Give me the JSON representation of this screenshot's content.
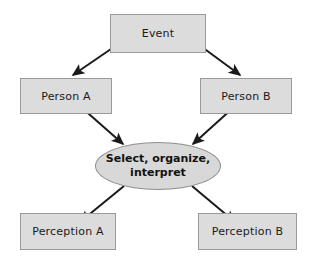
{
  "diagram": {
    "type": "flowchart",
    "colors": {
      "node_fill": "#dcdcdc",
      "node_border": "#9a9a9a",
      "ellipse_fill": "#d8d8d8",
      "ellipse_border": "#8f8f8f",
      "arrow": "#1a1a1a",
      "background": "#ffffff",
      "text": "#1a1a1a"
    },
    "nodes": [
      {
        "id": "event",
        "label": "Event",
        "shape": "rectangle"
      },
      {
        "id": "person_a",
        "label": "Person A",
        "shape": "rectangle"
      },
      {
        "id": "person_b",
        "label": "Person B",
        "shape": "rectangle"
      },
      {
        "id": "process",
        "label": "Select, organize, interpret",
        "line1": "Select, organize,",
        "line2": "interpret",
        "shape": "ellipse"
      },
      {
        "id": "perception_a",
        "label": "Perception A",
        "shape": "rectangle"
      },
      {
        "id": "perception_b",
        "label": "Perception B",
        "shape": "rectangle"
      }
    ],
    "edges": [
      {
        "from": "event",
        "to": "person_a",
        "style": "arrow"
      },
      {
        "from": "event",
        "to": "person_b",
        "style": "arrow"
      },
      {
        "from": "person_a",
        "to": "process",
        "style": "arrow"
      },
      {
        "from": "person_b",
        "to": "process",
        "style": "arrow"
      },
      {
        "from": "process",
        "to": "perception_a",
        "style": "arrow"
      },
      {
        "from": "process",
        "to": "perception_b",
        "style": "arrow"
      }
    ]
  }
}
